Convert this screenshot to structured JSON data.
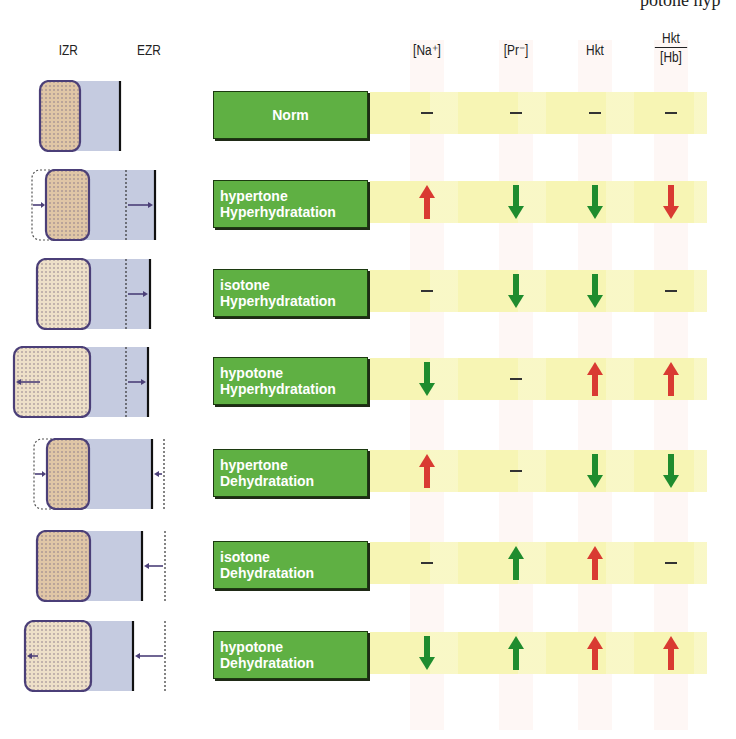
{
  "top_text": "potone hyp",
  "headers": {
    "izr": "IZR",
    "ezr": "EZR",
    "columns": [
      {
        "key": "na",
        "label": "[Na⁺]"
      },
      {
        "key": "pr",
        "label": "[Pr⁻]"
      },
      {
        "key": "hkt",
        "label": "Hkt"
      },
      {
        "key": "hkt_hb",
        "numerator": "Hkt",
        "denominator": "[Hb]"
      }
    ]
  },
  "colors": {
    "label_green": "#5fb043",
    "band_yellow": "#f7f5b4",
    "arrow_red": "#d93a32",
    "arrow_green": "#1f8c2e",
    "izr_fill": "#e0c6a6",
    "ezr_fill": "#c5cbe0",
    "outline": "#4b3f78"
  },
  "rows": [
    {
      "label_line1": "Norm",
      "label_line2": "",
      "values": [
        "none",
        "none",
        "none",
        "none"
      ]
    },
    {
      "label_line1": "hypertone",
      "label_line2": "Hyperhydratation",
      "values": [
        "up-red",
        "down-green",
        "down-green",
        "down-red"
      ]
    },
    {
      "label_line1": "isotone",
      "label_line2": "Hyperhydratation",
      "values": [
        "none",
        "down-green",
        "down-green",
        "none"
      ]
    },
    {
      "label_line1": "hypotone",
      "label_line2": "Hyperhydratation",
      "values": [
        "down-green",
        "none",
        "up-red",
        "up-red"
      ]
    },
    {
      "label_line1": "hypertone",
      "label_line2": "Dehydratation",
      "values": [
        "up-red",
        "none",
        "down-green",
        "down-green"
      ]
    },
    {
      "label_line1": "isotone",
      "label_line2": "Dehydratation",
      "values": [
        "none",
        "up-green",
        "up-red",
        "none"
      ]
    },
    {
      "label_line1": "hypotone",
      "label_line2": "Dehydratation",
      "values": [
        "down-green",
        "up-green",
        "up-red",
        "up-red"
      ]
    }
  ]
}
